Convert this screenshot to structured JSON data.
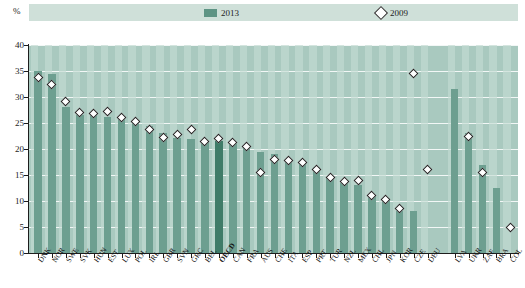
{
  "axis": {
    "unit_label": "%",
    "y_ticks": [
      "0",
      "5",
      "10",
      "15",
      "20",
      "25",
      "30",
      "35",
      "40"
    ]
  },
  "legend": {
    "items": [
      {
        "label": "2013",
        "marker": "filled-square",
        "color": "#5e9484"
      },
      {
        "label": "2009",
        "marker": "open-diamond",
        "color": "#ffffff"
      }
    ]
  },
  "colors": {
    "bar": "#6d9f90",
    "bar_highlight": "#3f7c68",
    "plot_background": "#a9c9bf",
    "column_stripe": "#c3dcd3",
    "gridline": "#ffffff",
    "axis": "#1d1d1d",
    "marker_fill": "#ffffff",
    "marker_stroke": "#222222"
  },
  "chart_data": {
    "type": "bar",
    "title": "",
    "xlabel": "",
    "ylabel": "%",
    "ylim": [
      0,
      40
    ],
    "ytick_step": 5,
    "grid": true,
    "legend_position": "top",
    "highlight_category": "OECD",
    "categories": [
      "DNK",
      "NOR",
      "SWE",
      "SVK",
      "HUN",
      "EST",
      "LUX",
      "POL",
      "IRL",
      "GBR",
      "SVN",
      "GRC",
      "BEL",
      "OECD",
      "CAN",
      "FRA",
      "AUS",
      "CHE",
      "ITA",
      "ESP",
      "PRT",
      "TUR",
      "NZL",
      "MEX",
      "CHL",
      "JPN",
      "KOR",
      "CZE",
      "DEU",
      "LVA",
      "UKR",
      "ZAF",
      "BRA",
      "COL"
    ],
    "group_break_after": "DEU",
    "series": [
      {
        "name": "2013",
        "values": [
          35.0,
          34.5,
          28.0,
          26.5,
          26.5,
          26.2,
          26.0,
          25.2,
          24.5,
          23.0,
          22.2,
          22.0,
          21.5,
          21.5,
          21.0,
          20.5,
          19.5,
          19.0,
          18.0,
          17.5,
          16.5,
          14.5,
          13.5,
          13.0,
          11.0,
          10.5,
          8.0,
          8.0,
          null,
          31.5,
          23.0,
          17.0,
          12.5,
          null
        ]
      },
      {
        "name": "2009",
        "values": [
          33.7,
          32.5,
          29.2,
          27.0,
          26.8,
          27.2,
          26.0,
          25.2,
          23.7,
          22.2,
          22.7,
          23.8,
          21.5,
          22.0,
          21.2,
          20.5,
          15.5,
          18.0,
          17.7,
          17.5,
          16.0,
          14.5,
          13.8,
          14.0,
          11.0,
          10.3,
          8.5,
          34.5,
          16.0,
          null,
          22.5,
          15.5,
          null,
          5.0
        ]
      }
    ]
  }
}
